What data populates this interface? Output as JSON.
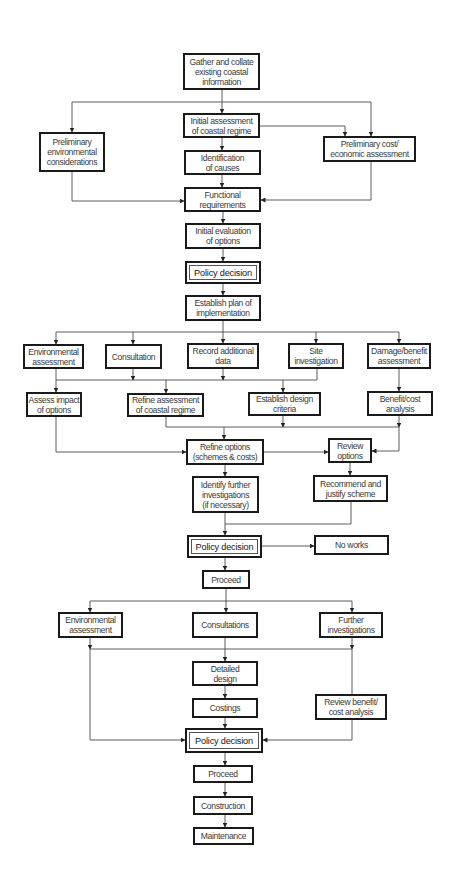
{
  "diagram": {
    "title": "",
    "nodes": {
      "gather": "Gather and collate\nexisting coastal\ninformation",
      "initial_assessment": "Initial assessment\nof coastal regime",
      "prelim_env": "Preliminary\nenvironmental\nconsiderations",
      "prelim_cost": "Preliminary cost/\neconomic assessment",
      "identification": "Identification\nof causes",
      "functional": "Functional\nrequirements",
      "initial_evaluation": "Initial evaluation\nof options",
      "policy_decision_1": "Policy decision",
      "establish_plan": "Establish plan of\nimplementation",
      "env_assessment_1": "Environmental\nassessment",
      "consultation": "Consultation",
      "record_data": "Record additional\ndata",
      "site_investigation": "Site\ninvestigation",
      "damage_benefit": "Damage/benefit\nassessment",
      "assess_impact": "Assess impact\nof options",
      "refine_assessment": "Refine assessment\nof coastal regime",
      "establish_design": "Establish design\ncriteria",
      "benefit_cost": "Benefit/cost\nanalysis",
      "refine_options": "Refine options\n(schemes & costs)",
      "review_options": "Review\noptions",
      "identify_further": "Identify further\ninvestigations\n(if necessary)",
      "recommend": "Recommend and\njustify scheme",
      "policy_decision_2": "Policy decision",
      "no_works": "No works",
      "proceed_1": "Proceed",
      "env_assessment_2": "Environmental\nassessment",
      "consultations": "Consultations",
      "further_investigations": "Further\ninvestigations",
      "detailed_design": "Detailed\ndesign",
      "costings": "Costings",
      "review_benefit": "Review benefit/\ncost analysis",
      "policy_decision_3": "Policy decision",
      "proceed_2": "Proceed",
      "construction": "Construction",
      "maintenance": "Maintenance"
    },
    "edges": [
      [
        "gather",
        "initial_assessment"
      ],
      [
        "gather",
        "prelim_env"
      ],
      [
        "gather",
        "prelim_cost"
      ],
      [
        "initial_assessment",
        "prelim_cost"
      ],
      [
        "initial_assessment",
        "identification"
      ],
      [
        "identification",
        "functional"
      ],
      [
        "prelim_env",
        "functional"
      ],
      [
        "prelim_cost",
        "functional"
      ],
      [
        "functional",
        "initial_evaluation"
      ],
      [
        "initial_evaluation",
        "policy_decision_1"
      ],
      [
        "policy_decision_1",
        "establish_plan"
      ],
      [
        "establish_plan",
        "env_assessment_1"
      ],
      [
        "establish_plan",
        "consultation"
      ],
      [
        "establish_plan",
        "record_data"
      ],
      [
        "establish_plan",
        "site_investigation"
      ],
      [
        "establish_plan",
        "damage_benefit"
      ],
      [
        "env_assessment_1",
        "assess_impact"
      ],
      [
        "consultation",
        "refine_assessment"
      ],
      [
        "record_data",
        "refine_assessment"
      ],
      [
        "site_investigation",
        "establish_design"
      ],
      [
        "damage_benefit",
        "benefit_cost"
      ],
      [
        "assess_impact",
        "refine_options"
      ],
      [
        "refine_assessment",
        "refine_options"
      ],
      [
        "establish_design",
        "refine_options"
      ],
      [
        "benefit_cost",
        "review_options"
      ],
      [
        "refine_options",
        "review_options"
      ],
      [
        "refine_options",
        "identify_further"
      ],
      [
        "review_options",
        "recommend"
      ],
      [
        "identify_further",
        "policy_decision_2"
      ],
      [
        "recommend",
        "policy_decision_2"
      ],
      [
        "policy_decision_2",
        "no_works"
      ],
      [
        "policy_decision_2",
        "proceed_1"
      ],
      [
        "proceed_1",
        "env_assessment_2"
      ],
      [
        "proceed_1",
        "consultations"
      ],
      [
        "proceed_1",
        "further_investigations"
      ],
      [
        "consultations",
        "detailed_design"
      ],
      [
        "env_assessment_2",
        "policy_decision_3"
      ],
      [
        "further_investigations",
        "review_benefit"
      ],
      [
        "review_benefit",
        "policy_decision_3"
      ],
      [
        "detailed_design",
        "costings"
      ],
      [
        "costings",
        "policy_decision_3"
      ],
      [
        "policy_decision_3",
        "proceed_2"
      ],
      [
        "proceed_2",
        "construction"
      ],
      [
        "construction",
        "maintenance"
      ]
    ]
  }
}
